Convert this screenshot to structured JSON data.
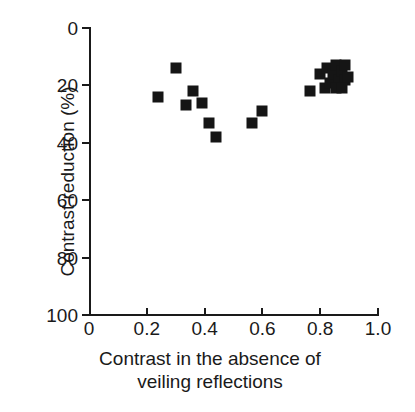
{
  "chart_data": {
    "type": "scatter",
    "title": "",
    "xlabel": "Contrast in the absence of veiling reflections",
    "xlabel_line1": "Contrast in the absence of",
    "xlabel_line2": "veiling reflections",
    "ylabel": "Contrast reduction (%)",
    "xlim": [
      0,
      1.0
    ],
    "ylim": [
      0,
      100
    ],
    "y_axis_inverted": true,
    "grid": false,
    "legend": null,
    "marker_color": "#151515",
    "marker_shape": "square",
    "xticks": [
      "0",
      "0.2",
      "0.4",
      "0.6",
      "0.8",
      "1.0"
    ],
    "xtick_values": [
      0,
      0.2,
      0.4,
      0.6,
      0.8,
      1.0
    ],
    "yticks": [
      "0",
      "20",
      "40",
      "60",
      "80",
      "100"
    ],
    "ytick_values": [
      0,
      20,
      40,
      60,
      80,
      100
    ],
    "series": [
      {
        "name": "Contrast reduction measurements",
        "points": [
          {
            "x": 0.3,
            "y": 14
          },
          {
            "x": 0.24,
            "y": 24
          },
          {
            "x": 0.36,
            "y": 22
          },
          {
            "x": 0.335,
            "y": 27
          },
          {
            "x": 0.39,
            "y": 26
          },
          {
            "x": 0.415,
            "y": 33
          },
          {
            "x": 0.44,
            "y": 38
          },
          {
            "x": 0.6,
            "y": 29
          },
          {
            "x": 0.565,
            "y": 33
          },
          {
            "x": 0.765,
            "y": 22
          },
          {
            "x": 0.8,
            "y": 16
          },
          {
            "x": 0.825,
            "y": 14
          },
          {
            "x": 0.815,
            "y": 21
          },
          {
            "x": 0.835,
            "y": 19
          },
          {
            "x": 0.845,
            "y": 16
          },
          {
            "x": 0.855,
            "y": 13
          },
          {
            "x": 0.865,
            "y": 18
          },
          {
            "x": 0.855,
            "y": 21
          },
          {
            "x": 0.875,
            "y": 15
          },
          {
            "x": 0.885,
            "y": 13
          },
          {
            "x": 0.885,
            "y": 18
          },
          {
            "x": 0.895,
            "y": 17
          },
          {
            "x": 0.875,
            "y": 21
          }
        ]
      }
    ]
  }
}
